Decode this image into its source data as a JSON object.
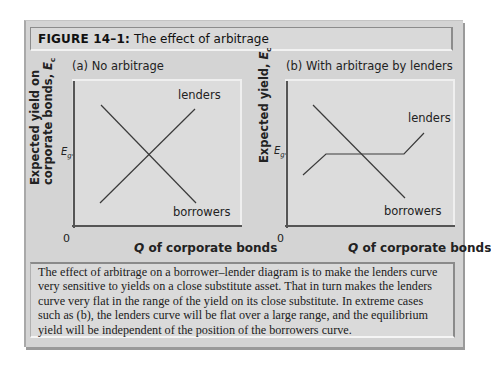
{
  "figure": {
    "number_label": "FIGURE 14–1:",
    "title": "The effect of arbitrage"
  },
  "panels": [
    {
      "label": "(a) No arbitrage",
      "ylabel_line1": "Expected yield on",
      "ylabel_line2": "corporate bonds, ",
      "ylabel_var": "E",
      "ylabel_sub": "c",
      "eg_label": "E",
      "eg_sub": "g",
      "origin": "0",
      "xlabel_q": "Q",
      "xlabel_rest": " of corporate bonds",
      "lenders_label": "lenders",
      "borrowers_label": "borrowers"
    },
    {
      "label": "(b) With arbitrage by lenders",
      "ylabel_line1": "Expected yield, ",
      "ylabel_var": "E",
      "ylabel_sub": "c",
      "eg_label": "E",
      "eg_sub": "g",
      "origin": "0",
      "xlabel_q": "Q",
      "xlabel_rest": " of corporate bonds",
      "lenders_label": "lenders",
      "borrowers_label": "borrowers"
    }
  ],
  "caption": "The effect of arbitrage on a borrower–lender diagram is to make the lenders curve very sensitive to yields on a close substitute asset. That in turn makes the lenders curve very flat in the range of the yield on its close substitute. In extreme cases such as (b), the lenders curve will be flat over a large range, and the equilibrium yield will be independent of the position of the borrowers curve.",
  "colors": {
    "frame_bg": "#d4d4d4",
    "line": "#3a3a3a",
    "text": "#222222"
  }
}
